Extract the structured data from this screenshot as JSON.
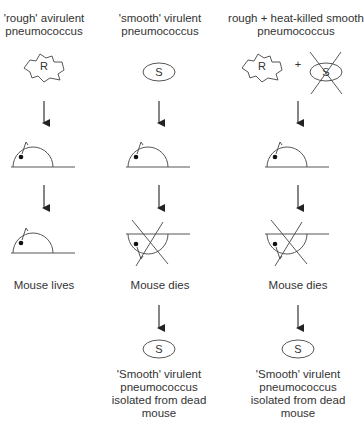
{
  "columns": [
    {
      "title_line1": "'rough' avirulent",
      "title_line2": "pneumococcus",
      "organism_letter": "R",
      "outcome": "Mouse lives"
    },
    {
      "title_line1": "'smooth' virulent",
      "title_line2": "pneumococcus",
      "organism_letter": "S",
      "outcome": "Mouse dies",
      "isolated_letter": "S",
      "isolated_line1": "'Smooth' virulent",
      "isolated_line2": "pneumococcus",
      "isolated_line3": "isolated from dead",
      "isolated_line4": "mouse"
    },
    {
      "title_line1": "rough + heat-killed smooth",
      "title_line2": "pneumococcus",
      "organism_letter": "R",
      "plus": "+",
      "killed_letter": "S",
      "outcome": "Mouse dies",
      "isolated_letter": "S",
      "isolated_line1": "'Smooth' virulent",
      "isolated_line2": "pneumococcus",
      "isolated_line3": "isolated from dead",
      "isolated_line4": "mouse"
    }
  ]
}
